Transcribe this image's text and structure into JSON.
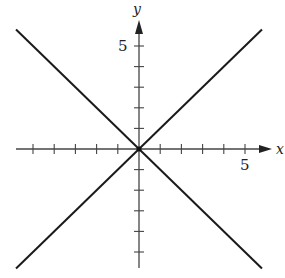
{
  "chart_data": {
    "type": "line",
    "title": "",
    "xlabel": "x",
    "ylabel": "y",
    "xlim": [
      -6,
      6
    ],
    "ylim": [
      -6,
      6
    ],
    "x_tick_label": "5",
    "y_tick_label": "5",
    "ticks": {
      "x": [
        -5,
        -4,
        -3,
        -2,
        -1,
        1,
        2,
        3,
        4,
        5
      ],
      "y": [
        -5,
        -4,
        -3,
        -2,
        -1,
        1,
        2,
        3,
        4,
        5
      ]
    },
    "grid": false,
    "series": [
      {
        "name": "y = x",
        "x": [
          -6,
          6
        ],
        "y": [
          -6,
          6
        ]
      },
      {
        "name": "y = -x",
        "x": [
          -6,
          6
        ],
        "y": [
          6,
          -6
        ]
      }
    ]
  },
  "labels": {
    "x_axis": "x",
    "y_axis": "y",
    "x_five": "5",
    "y_five": "5"
  }
}
